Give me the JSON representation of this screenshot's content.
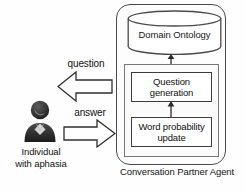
{
  "agent": {
    "caption": "Conversation Partner Agent",
    "ontology": {
      "label": "Domain Ontology",
      "icon": "database-cylinder-icon"
    },
    "processes": [
      {
        "id": "question-generation",
        "label": "Question\ngeneration",
        "line1": "Question",
        "line2": "generation"
      },
      {
        "id": "word-probability-update",
        "label": "Word probability\nupdate",
        "line1": "Word probability",
        "line2": "update"
      }
    ],
    "connectors": [
      {
        "id": "ontology-link",
        "icon": "double-headed-vertical-arrow-icon",
        "direction": "bidirectional"
      },
      {
        "id": "process-link",
        "icon": "up-arrow-icon",
        "direction": "up"
      }
    ]
  },
  "user": {
    "label_line1": "Individual",
    "label_line2": "with aphasia",
    "avatar_icon": "person-avatar-icon"
  },
  "flows": [
    {
      "id": "question",
      "label": "question",
      "direction": "left",
      "icon": "block-arrow-left-icon"
    },
    {
      "id": "answer",
      "label": "answer",
      "direction": "right",
      "icon": "block-arrow-right-icon"
    }
  ],
  "colors": {
    "outline": "#4a4a4a",
    "box_outline": "#3d3d3d",
    "text": "#111111",
    "background": "#ffffff",
    "avatar_dark": "#2e2e2e",
    "avatar_mid": "#6e6e6e"
  }
}
